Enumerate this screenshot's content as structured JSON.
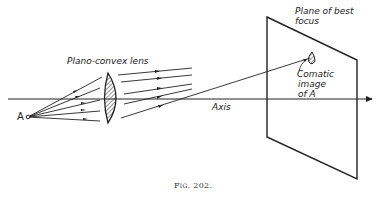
{
  "figure": {
    "caption": "Fig. 202.",
    "labels": {
      "lens": "Plano-convex lens",
      "plane_line1": "Plane of best",
      "plane_line2": "focus",
      "image_line1": "Comatic",
      "image_line2": "image",
      "image_line3": "of A",
      "axis": "Axis",
      "point": "A"
    }
  }
}
